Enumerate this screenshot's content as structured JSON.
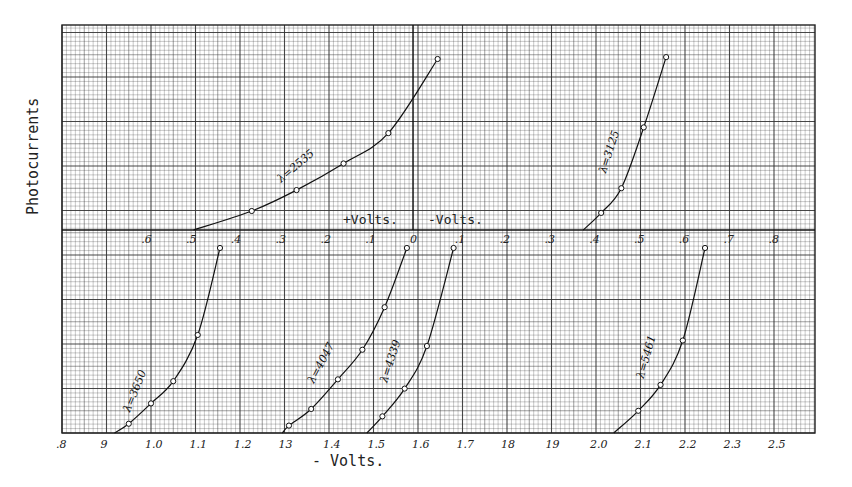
{
  "chart_data": {
    "type": "line",
    "title": "",
    "ylabel": "Photocurrents",
    "xlabel": "- Volts.",
    "panels": [
      {
        "name": "upper",
        "xlabel_left": "+Volts.",
        "xlabel_right": "-Volts.",
        "x_note": "signed potential; positive to the left of 0, negative to the right",
        "xlim": [
          0.6,
          -0.8
        ],
        "tick_labels": [
          ".6",
          ".5",
          ".4",
          ".3",
          ".2",
          ".1",
          "0",
          ".1",
          ".2",
          ".3",
          ".4",
          ".5",
          ".6",
          ".7",
          ".8"
        ],
        "tick_values": [
          0.6,
          0.5,
          0.4,
          0.3,
          0.2,
          0.1,
          0.0,
          -0.1,
          -0.2,
          -0.3,
          -0.4,
          -0.5,
          -0.6,
          -0.7,
          -0.8
        ],
        "ylim": [
          0,
          1
        ],
        "series": [
          {
            "name": "λ=2535",
            "label": "λ=2535",
            "x": [
              0.49,
              0.36,
              0.26,
              0.155,
              0.055,
              -0.055
            ],
            "y": [
              0.0,
              0.1,
              0.21,
              0.35,
              0.51,
              0.9
            ],
            "markers": [
              false,
              true,
              true,
              true,
              true,
              true
            ]
          },
          {
            "name": "λ=3125",
            "label": "λ=3125",
            "x": [
              -0.38,
              -0.42,
              -0.465,
              -0.515,
              -0.565
            ],
            "y": [
              0.0,
              0.09,
              0.22,
              0.54,
              0.91
            ],
            "markers": [
              false,
              true,
              true,
              true,
              true
            ]
          }
        ]
      },
      {
        "name": "lower",
        "xlabel": "- Volts.",
        "xlim": [
          0.8,
          2.5
        ],
        "tick_labels": [
          ".8",
          "9",
          "1.0",
          "1.1",
          "1.2",
          "13",
          "1.4",
          "1.5",
          "1.6",
          "1.7",
          "18",
          "19",
          "2.0",
          "2.1",
          "2.2",
          "2.3",
          "2.5"
        ],
        "tick_values": [
          0.8,
          0.9,
          1.0,
          1.1,
          1.2,
          1.3,
          1.4,
          1.5,
          1.6,
          1.7,
          1.8,
          1.9,
          2.0,
          2.1,
          2.2,
          2.3,
          2.4
        ],
        "ylim": [
          0,
          1
        ],
        "series": [
          {
            "name": "λ=3650",
            "label": "λ=3650",
            "x": [
              0.918,
              0.95,
              1.0,
              1.05,
              1.105,
              1.155
            ],
            "y": [
              0.0,
              0.05,
              0.16,
              0.28,
              0.53,
              1.0
            ],
            "markers": [
              false,
              true,
              true,
              true,
              true,
              true
            ]
          },
          {
            "name": "λ=4047",
            "label": "λ=4047",
            "x": [
              1.295,
              1.31,
              1.36,
              1.42,
              1.475,
              1.525,
              1.575
            ],
            "y": [
              0.0,
              0.04,
              0.13,
              0.29,
              0.45,
              0.68,
              1.0
            ],
            "markers": [
              false,
              true,
              true,
              true,
              true,
              true,
              true
            ]
          },
          {
            "name": "λ=4339",
            "label": "λ=4339",
            "x": [
              1.485,
              1.52,
              1.57,
              1.62,
              1.68
            ],
            "y": [
              0.0,
              0.09,
              0.24,
              0.47,
              1.0
            ],
            "markers": [
              false,
              true,
              true,
              true,
              true
            ]
          },
          {
            "name": "λ=5461",
            "label": "λ=5461",
            "x": [
              2.04,
              2.095,
              2.145,
              2.195,
              2.245
            ],
            "y": [
              0.0,
              0.12,
              0.26,
              0.5,
              1.0
            ],
            "markers": [
              false,
              true,
              true,
              true,
              true
            ]
          }
        ]
      }
    ],
    "grid": true,
    "legend": "none (curves labelled inline)"
  }
}
